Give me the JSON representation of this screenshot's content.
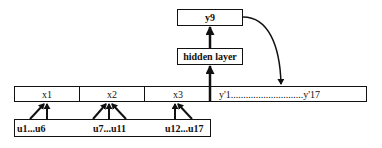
{
  "diagram": {
    "output_node": {
      "label": "y9"
    },
    "hidden_node": {
      "label": "hidden layer"
    },
    "input_layer": {
      "cells": [
        {
          "label": "x1"
        },
        {
          "label": "x2"
        },
        {
          "label": "x3"
        }
      ],
      "context_label": "y'1.............................y'17"
    },
    "source_layer": {
      "groups": [
        {
          "label": "u1...u6"
        },
        {
          "label": "u7...u11"
        },
        {
          "label": "u12...u17"
        }
      ]
    },
    "edges": [
      {
        "from": "u1...u6",
        "to": "x1"
      },
      {
        "from": "u7...u11",
        "to": "x2"
      },
      {
        "from": "u12...u17",
        "to": "x3"
      },
      {
        "from": "input_layer",
        "to": "hidden layer"
      },
      {
        "from": "hidden layer",
        "to": "y9"
      },
      {
        "from": "y9",
        "to": "y'1...y'17",
        "style": "curved"
      }
    ],
    "colors": {
      "stroke": "#111111",
      "background": "#ffffff"
    }
  }
}
